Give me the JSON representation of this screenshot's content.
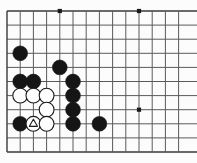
{
  "diagram": {
    "kind": "go-board-diagram",
    "board": {
      "columns": 14,
      "rows": 11,
      "origin_x": 7,
      "origin_y": 11,
      "spacing_x": 13.2,
      "spacing_y": 14.1,
      "edge_extends_right": true,
      "edge_extends_left_top_bottom": true,
      "line_color": "#5a5a5a",
      "border_color": "#3a3a3a",
      "background_color": "#fcfcfc",
      "line_width": 1
    },
    "star_points": [
      {
        "col": 4,
        "row": 0
      },
      {
        "col": 10,
        "row": 0
      },
      {
        "col": 10,
        "row": 7
      }
    ],
    "stones": [
      {
        "col": 1,
        "row": 3,
        "color": "black",
        "mark": "none"
      },
      {
        "col": 4,
        "row": 4,
        "color": "black",
        "mark": "none"
      },
      {
        "col": 1,
        "row": 5,
        "color": "black",
        "mark": "none"
      },
      {
        "col": 2,
        "row": 5,
        "color": "black",
        "mark": "none"
      },
      {
        "col": 5,
        "row": 5,
        "color": "black",
        "mark": "none"
      },
      {
        "col": 1,
        "row": 6,
        "color": "white",
        "mark": "none"
      },
      {
        "col": 2,
        "row": 6,
        "color": "white",
        "mark": "none"
      },
      {
        "col": 3,
        "row": 6,
        "color": "white",
        "mark": "none"
      },
      {
        "col": 5,
        "row": 6,
        "color": "black",
        "mark": "none"
      },
      {
        "col": 3,
        "row": 7,
        "color": "white",
        "mark": "none"
      },
      {
        "col": 5,
        "row": 7,
        "color": "black",
        "mark": "none"
      },
      {
        "col": 1,
        "row": 8,
        "color": "black",
        "mark": "none"
      },
      {
        "col": 2,
        "row": 8,
        "color": "white",
        "mark": "triangle"
      },
      {
        "col": 3,
        "row": 8,
        "color": "white",
        "mark": "none"
      },
      {
        "col": 5,
        "row": 8,
        "color": "black",
        "mark": "none"
      },
      {
        "col": 7,
        "row": 8,
        "color": "black",
        "mark": "none"
      }
    ],
    "colors": {
      "black_stone": "#151515",
      "white_stone": "#fdfdfd",
      "white_stone_outline": "#1a1a1a",
      "triangle_mark": "#1a1a1a",
      "star_point": "#1a1a1a"
    },
    "stone_radius": 7.4
  }
}
